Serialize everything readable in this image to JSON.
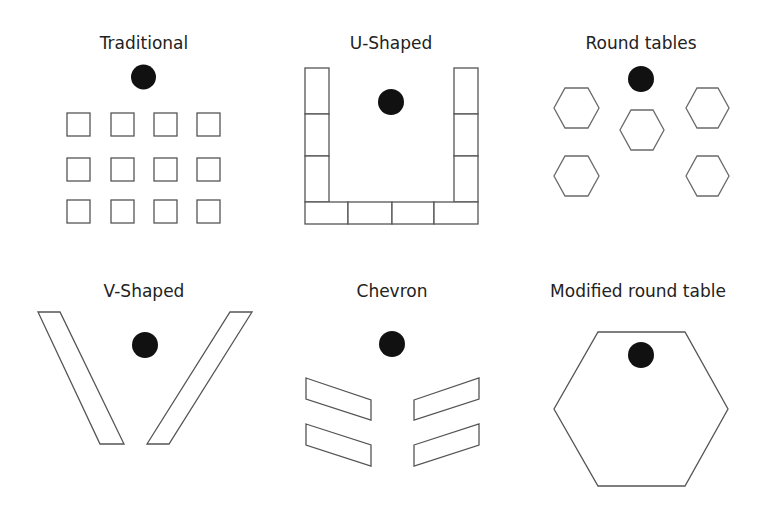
{
  "figure": {
    "colors": {
      "background": "#ffffff",
      "outline": "#555555",
      "instructor_dot": "#111111",
      "text": "#222222"
    },
    "panels": [
      {
        "id": "traditional",
        "title": "Traditional",
        "instructor": true,
        "seats": "4 x 3 grid of small square desks"
      },
      {
        "id": "u-shaped",
        "title": "U-Shaped",
        "instructor": true,
        "seats": "3 tables on each side, 4 along the bottom"
      },
      {
        "id": "round-tables",
        "title": "Round tables",
        "instructor": true,
        "seats": "5 hexagonal tables"
      },
      {
        "id": "v-shaped",
        "title": "V-Shaped",
        "instructor": true,
        "seats": "2 long slanted tables"
      },
      {
        "id": "chevron",
        "title": "Chevron",
        "instructor": true,
        "seats": "2 angled tables on each side"
      },
      {
        "id": "modified-round-table",
        "title": "Modified round table",
        "instructor": true,
        "seats": "1 large hexagonal table"
      }
    ]
  }
}
